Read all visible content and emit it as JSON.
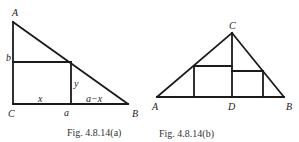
{
  "figures": [
    {
      "id": "a",
      "caption": "Fig. 4.8.14(a)",
      "labels": {
        "A": "A",
        "B": "B",
        "C": "C",
        "b": "b",
        "y": "y",
        "x": "x",
        "a": "a",
        "a_minus_x": "a−x"
      }
    },
    {
      "id": "b",
      "caption": "Fig. 4.8.14(b)",
      "labels": {
        "A": "A",
        "B": "B",
        "C": "C",
        "D": "D"
      }
    }
  ]
}
